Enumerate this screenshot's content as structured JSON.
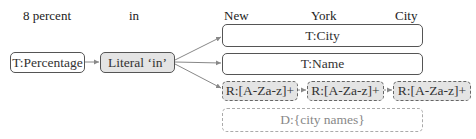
{
  "tokens": [
    {
      "id": "tok-8-percent",
      "text": "8 percent"
    },
    {
      "id": "tok-in",
      "text": "in"
    },
    {
      "id": "tok-new",
      "text": "New"
    },
    {
      "id": "tok-york",
      "text": "York"
    },
    {
      "id": "tok-city",
      "text": "City"
    }
  ],
  "nodes": {
    "percentage": "T:Percentage",
    "literal": "Literal ‘in’",
    "city": "T:City",
    "name": "T:Name",
    "regex1": "R:[A-Za-z]+",
    "regex2": "R:[A-Za-z]+",
    "regex3": "R:[A-Za-z]+",
    "dictionary": "D:{city names}"
  },
  "colors": {
    "stroke": "#555555",
    "fill_gray": "#e4e4e4",
    "arrow": "#888888",
    "dashed_light": "#aaaaaa"
  }
}
